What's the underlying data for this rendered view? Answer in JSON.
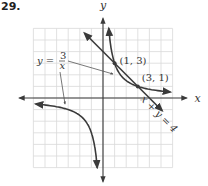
{
  "problem_number": "29.",
  "chart_data": {
    "type": "line",
    "title": "",
    "xlabel": "x",
    "ylabel": "y",
    "xlim": [
      -6,
      6
    ],
    "ylim": [
      -6,
      6
    ],
    "grid": true,
    "series": [
      {
        "name": "y = 3/x",
        "label_parts": {
          "lhs": "y =",
          "num": "3",
          "den": "x"
        },
        "kind": "hyperbola",
        "k": 3,
        "branches": [
          {
            "x_from": 0.5,
            "x_to": 5.8
          },
          {
            "x_from": -5.8,
            "x_to": -0.5
          }
        ]
      },
      {
        "name": "x + y = 4",
        "label": "x + y = 4",
        "kind": "line",
        "points": [
          [
            -1.6,
            5.6
          ],
          [
            5.1,
            -1.1
          ]
        ]
      }
    ],
    "intersections": [
      {
        "x": 1,
        "y": 3,
        "label": "(1, 3)"
      },
      {
        "x": 3,
        "y": 1,
        "label": "(3, 1)"
      }
    ]
  }
}
